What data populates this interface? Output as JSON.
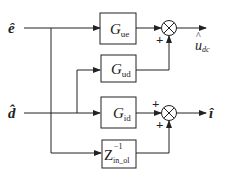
{
  "diagram": {
    "inputs": [
      {
        "name": "e_hat",
        "label": "ê"
      },
      {
        "name": "d_hat",
        "label": "d̂"
      }
    ],
    "blocks": [
      {
        "id": "Gue",
        "main": "G",
        "sub": "ue"
      },
      {
        "id": "Gud",
        "main": "G",
        "sub": "ud"
      },
      {
        "id": "Gid",
        "main": "G",
        "sub": "id"
      },
      {
        "id": "Zin",
        "main": "Z",
        "sup": "−1",
        "sub": "in_ol"
      }
    ],
    "summing_junctions": [
      {
        "id": "sum1",
        "signs": [
          "+"
        ]
      },
      {
        "id": "sum2",
        "signs": [
          "+",
          "+"
        ]
      }
    ],
    "outputs": [
      {
        "name": "u_dc_hat",
        "hat": "^",
        "main": "u",
        "sub": "dc"
      },
      {
        "name": "i_hat",
        "label": "î"
      }
    ],
    "colors": {
      "line": "#222222",
      "background": "#ffffff"
    }
  }
}
